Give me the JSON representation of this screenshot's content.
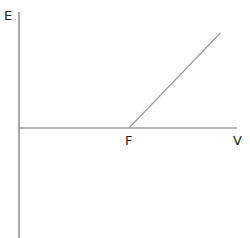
{
  "chart_data": {
    "type": "line",
    "title": "",
    "xlabel": "V",
    "ylabel": "E",
    "x_tick_labels": [
      {
        "label": "F",
        "x": 1
      }
    ],
    "xlim": [
      0,
      2
    ],
    "ylim": [
      -1.22,
      1.22
    ],
    "series": [
      {
        "name": "E vs V",
        "x": [
          1,
          1.83
        ],
        "y": [
          0,
          1.0
        ]
      }
    ],
    "grid": false,
    "legend": "none"
  },
  "colors": {
    "axis": "#707070",
    "line": "#9a9a9a",
    "text": "#222222"
  }
}
